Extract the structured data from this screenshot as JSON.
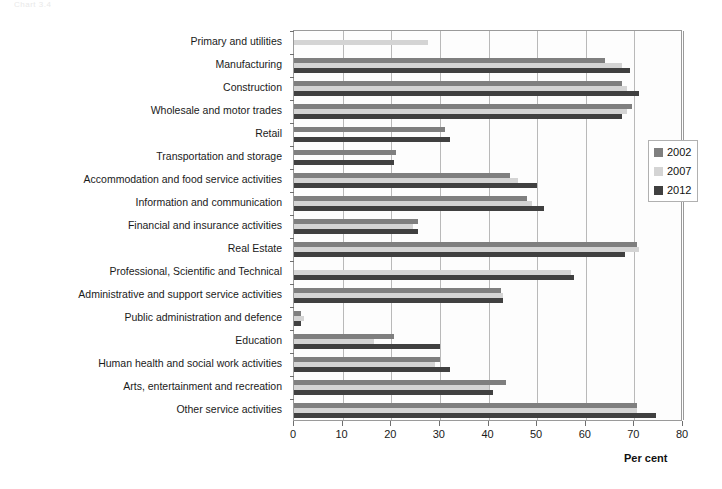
{
  "page": {
    "ghost_caption": "Chart 3.4"
  },
  "chart_data": {
    "type": "bar",
    "orientation": "horizontal",
    "title": "",
    "xlabel": "Per cent",
    "ylabel": "",
    "xlim": [
      0,
      80
    ],
    "xticks": [
      0,
      10,
      20,
      30,
      40,
      50,
      60,
      70,
      80
    ],
    "grid": true,
    "legend_position": "right",
    "categories": [
      "Primary and utilities",
      "Manufacturing",
      "Construction",
      "Wholesale and motor trades",
      "Retail",
      "Transportation and storage",
      "Accommodation and food service activities",
      "Information and communication",
      "Financial and insurance activities",
      "Real Estate",
      "Professional, Scientific and Technical",
      "Administrative and support service activities",
      "Public administration and defence",
      "Education",
      "Human health and social work activities",
      "Arts, entertainment and recreation",
      "Other service activities"
    ],
    "series": [
      {
        "name": "2002",
        "color": "#7f7f7f",
        "values": [
          null,
          64.0,
          67.5,
          69.5,
          31.0,
          21.0,
          44.5,
          48.0,
          25.5,
          70.5,
          null,
          42.5,
          1.5,
          20.5,
          30.0,
          43.5,
          70.5
        ]
      },
      {
        "name": "2007",
        "color": "#d4d4d4",
        "values": [
          27.5,
          67.5,
          68.5,
          68.5,
          null,
          null,
          46.0,
          49.0,
          24.5,
          71.0,
          57.0,
          43.0,
          2.0,
          16.5,
          29.0,
          40.0,
          70.5
        ]
      },
      {
        "name": "2012",
        "color": "#404040",
        "values": [
          null,
          69.0,
          71.0,
          67.5,
          32.0,
          20.5,
          50.0,
          51.5,
          25.5,
          68.0,
          57.5,
          43.0,
          1.5,
          30.0,
          32.0,
          41.0,
          74.5
        ]
      }
    ]
  }
}
